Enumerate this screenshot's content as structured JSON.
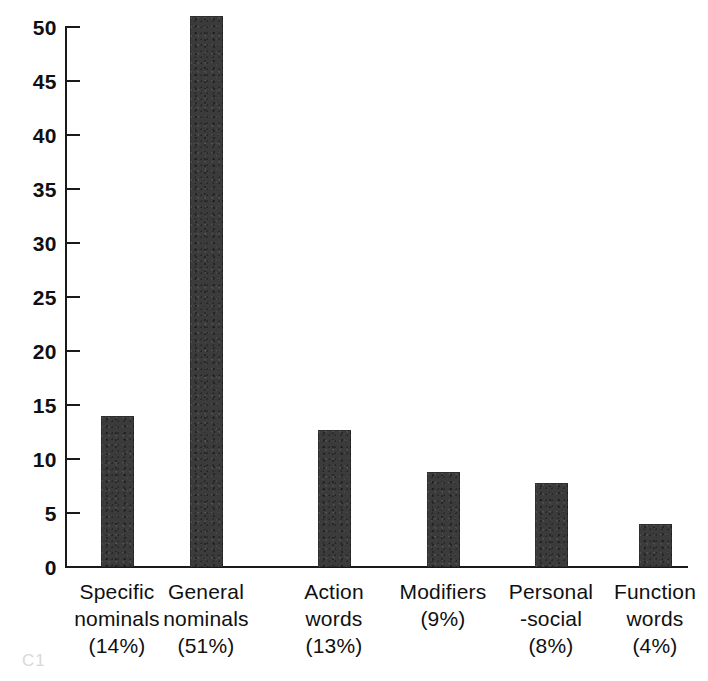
{
  "chart_data": {
    "type": "bar",
    "title": "",
    "subtitle": "",
    "xlabel": "",
    "ylabel": "",
    "categories": [
      "Specific nominals (14%)",
      "General nominals (51%)",
      "Action words (13%)",
      "Modifiers (9%)",
      "Personal-social (8%)",
      "Function words (4%)"
    ],
    "values": [
      14.0,
      51.0,
      12.7,
      8.8,
      7.8,
      4.0
    ],
    "percent_labels": [
      "(14%)",
      "(51%)",
      "(13%)",
      "(9%)",
      "(8%)",
      "(4%)"
    ],
    "ylim": [
      0,
      50
    ],
    "y_ticks": [
      0,
      5,
      10,
      15,
      20,
      25,
      30,
      35,
      40,
      45,
      50
    ],
    "y_tick_labels": [
      "0",
      "5",
      "10",
      "15",
      "20",
      "25",
      "30",
      "35",
      "40",
      "45",
      "50"
    ],
    "grid": false,
    "legend": "none",
    "bar_color": "#3b3b3b",
    "axis_color": "#1a1a1a",
    "background_color": "#ffffff"
  },
  "axis": {
    "y_ticks": [
      {
        "label": "50",
        "value": 50
      },
      {
        "label": "45",
        "value": 45
      },
      {
        "label": "40",
        "value": 40
      },
      {
        "label": "35",
        "value": 35
      },
      {
        "label": "30",
        "value": 30
      },
      {
        "label": "25",
        "value": 25
      },
      {
        "label": "20",
        "value": 20
      },
      {
        "label": "15",
        "value": 15
      },
      {
        "label": "10",
        "value": 10
      },
      {
        "label": "5",
        "value": 5
      },
      {
        "label": "0",
        "value": 0
      }
    ]
  },
  "x_labels": [
    {
      "line1": "Specific",
      "line2": "nominals",
      "line3": "(14%)"
    },
    {
      "line1": "General",
      "line2": "nominals",
      "line3": "(51%)"
    },
    {
      "line1": "Action",
      "line2": "words",
      "line3": "(13%)"
    },
    {
      "line1": "Modifiers",
      "line2": "(9%)",
      "line3": ""
    },
    {
      "line1": "Personal",
      "line2": "-social",
      "line3": "(8%)"
    },
    {
      "line1": "Function",
      "line2": "words",
      "line3": "(4%)"
    }
  ],
  "caption_remnant": "C1"
}
